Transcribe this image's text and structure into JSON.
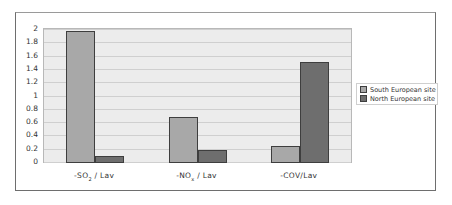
{
  "chart_data": {
    "type": "bar",
    "title": "",
    "xlabel": "",
    "ylabel": "",
    "categories": [
      "-SO2 / Lav",
      "-NOx / Lav",
      "-COV/Lav"
    ],
    "category_labels": [
      {
        "prefix": "-SO",
        "sub": "2",
        "suffix": " / Lav"
      },
      {
        "prefix": "-NO",
        "sub": "x",
        "suffix": " / Lav"
      },
      {
        "prefix": "-COV/Lav",
        "sub": "",
        "suffix": ""
      }
    ],
    "series": [
      {
        "name": "South European site",
        "color": "#a8a8a8",
        "values": [
          1.98,
          0.69,
          0.26
        ]
      },
      {
        "name": "North European site",
        "color": "#6e6e6e",
        "values": [
          0.1,
          0.2,
          1.52
        ]
      }
    ],
    "ylim": [
      0,
      2
    ],
    "yticks": [
      "2",
      "1.8",
      "1.6",
      "1.4",
      "1.2",
      "1",
      "0.8",
      "0.6",
      "0.4",
      "0.2",
      "0"
    ],
    "grid": true,
    "legend_position": "right"
  }
}
